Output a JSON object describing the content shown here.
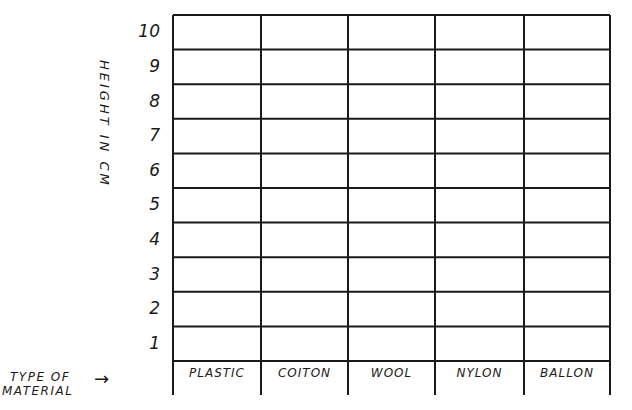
{
  "chart_data": {
    "type": "bar",
    "title": "",
    "xlabel": "TYPE OF MATERIAL",
    "ylabel": "HEIGHT IN CM",
    "categories": [
      "PLASTIC",
      "COTTON",
      "WOOL",
      "NYLON",
      "BALLON"
    ],
    "category_labels_as_drawn": [
      "PLASTIC",
      "COITON",
      "WOOL",
      "NYLON",
      "BALLON"
    ],
    "values": [
      null,
      null,
      null,
      null,
      null
    ],
    "yticks": [
      "1",
      "2",
      "3",
      "4",
      "5",
      "6",
      "7",
      "8",
      "9",
      "10"
    ],
    "ylim": [
      0,
      10
    ],
    "grid": true,
    "legend": null,
    "note": "Blank hand-drawn chart grid; no data plotted"
  },
  "labels": {
    "ylabel": "HEIGHT IN CM",
    "xtitle_line1": "TYPE OF",
    "xtitle_line2": "MATERIAL",
    "arrow": "→",
    "categories": [
      "PLASTIC",
      "COITON",
      "WOOL",
      "NYLON",
      "BALLON"
    ],
    "yticks": [
      "10",
      "9",
      "8",
      "7",
      "6",
      "5",
      "4",
      "3",
      "2",
      "1"
    ]
  }
}
